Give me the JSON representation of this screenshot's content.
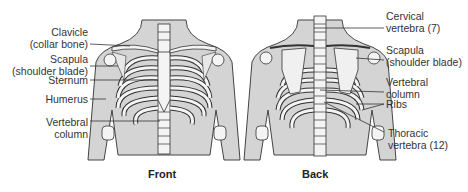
{
  "diagram": {
    "views": [
      {
        "id": "front",
        "caption": "Front"
      },
      {
        "id": "back",
        "caption": "Back"
      }
    ],
    "front_labels": [
      {
        "text": "Clavicle",
        "sub": "(collar bone)"
      },
      {
        "text": "Scapula",
        "sub": "(shoulder blade)"
      },
      {
        "text": "Sternum",
        "sub": ""
      },
      {
        "text": "Humerus",
        "sub": ""
      },
      {
        "text": "Vertebral",
        "sub": "column"
      }
    ],
    "back_labels": [
      {
        "text": "Cervical",
        "sub": "vertebra (7)"
      },
      {
        "text": "Scapula",
        "sub": "(shoulder blade)"
      },
      {
        "text": "Vertebral",
        "sub": "column"
      },
      {
        "text": "Ribs",
        "sub": ""
      },
      {
        "text": "Thoracic",
        "sub": "vertebra (12)"
      }
    ],
    "colors": {
      "body_fill": "#d4d4d4",
      "bone_fill": "#f4f4f4",
      "outline": "#333333",
      "text": "#333333"
    }
  }
}
